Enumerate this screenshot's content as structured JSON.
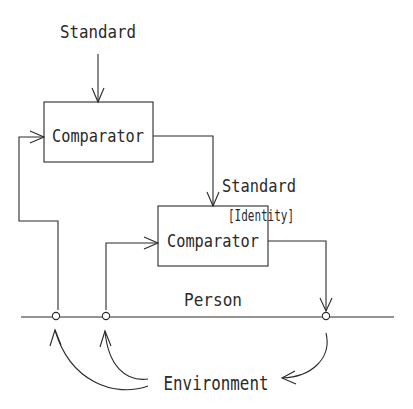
{
  "diagram": {
    "top_standard_label": "Standard",
    "top_comparator_label": "Comparator",
    "mid_standard_label": "Standard",
    "identity_label": "[Identity]",
    "lower_comparator_label": "Comparator",
    "person_label": "Person",
    "environment_label": "Environment",
    "stroke_color": "#2a2a2a"
  }
}
